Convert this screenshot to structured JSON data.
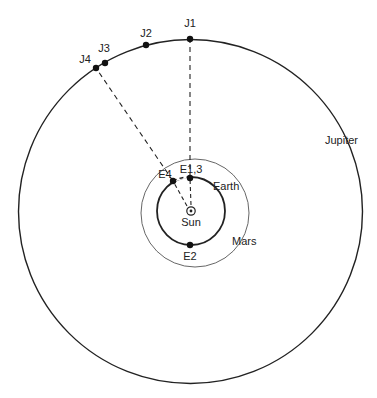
{
  "diagram": {
    "colors": {
      "background": "#ffffff",
      "ink": "#222222",
      "mars_orbit": "#555555"
    },
    "sun": {
      "label": "Sun",
      "cx": 191,
      "cy": 211
    },
    "orbits": {
      "earth": {
        "label": "Earth",
        "cx": 191,
        "cy": 211,
        "r": 34
      },
      "mars": {
        "label": "Mars",
        "cx": 195,
        "cy": 213,
        "r": 54
      },
      "jupiter": {
        "label": "Jupiter",
        "cx": 190.5,
        "cy": 211.5,
        "r": 172
      }
    },
    "earth_positions": [
      {
        "label": "E1,3",
        "x": 190,
        "y": 178
      },
      {
        "label": "E2",
        "x": 190,
        "y": 245
      },
      {
        "label": "E4",
        "x": 173,
        "y": 181
      }
    ],
    "jupiter_positions": [
      {
        "label": "J1",
        "x": 190,
        "y": 39
      },
      {
        "label": "J2",
        "x": 146,
        "y": 45
      },
      {
        "label": "J3",
        "x": 105,
        "y": 63
      },
      {
        "label": "J4",
        "x": 96,
        "y": 68
      }
    ],
    "sight_lines": [
      {
        "from": "E1,3",
        "to": "J1"
      },
      {
        "from": "E4",
        "to": "J4"
      },
      {
        "from": "Sun",
        "to": "E1,3"
      },
      {
        "from": "Sun",
        "to": "E4"
      }
    ]
  }
}
